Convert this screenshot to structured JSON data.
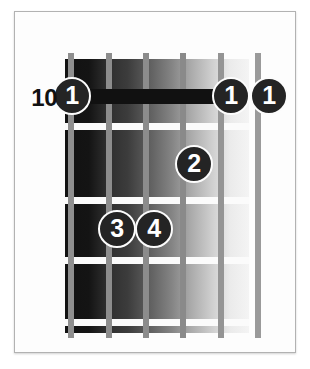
{
  "diagram": {
    "fret_position_label": "10",
    "strings_count": 6,
    "frets_count": 5,
    "colors": {
      "dot_fill": "#242424",
      "dot_text": "#ffffff",
      "dot_ring": "#fcfcfc",
      "fret_wire": "#fbfbfb",
      "string": "#8d8d8d",
      "barre": "#111111",
      "frame_border": "#b2b2b2",
      "page_background": "#ffffff",
      "fretboard_dark": "#121212",
      "fretboard_light": "#f4f4f4"
    },
    "barre": {
      "finger": "1",
      "from_string": 1,
      "to_string": 5,
      "fret": 1
    },
    "fingerings": [
      {
        "finger": "1",
        "string": 1,
        "fret": 1,
        "x": 71,
        "y": 95
      },
      {
        "finger": "1",
        "string": 5,
        "fret": 1,
        "x": 230,
        "y": 95
      },
      {
        "finger": "1",
        "string": 6,
        "fret": 1,
        "x": 268,
        "y": 95
      },
      {
        "finger": "2",
        "string": 4,
        "fret": 3,
        "x": 193,
        "y": 163
      },
      {
        "finger": "3",
        "string": 2,
        "fret": 4,
        "x": 116,
        "y": 228
      },
      {
        "finger": "4",
        "string": 3,
        "fret": 4,
        "x": 153,
        "y": 228
      }
    ],
    "string_positions": [
      70,
      108,
      145,
      182,
      220,
      257
    ],
    "fret_line_positions": [
      122,
      196,
      256,
      318
    ]
  }
}
